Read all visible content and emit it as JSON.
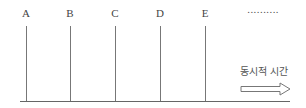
{
  "diagram": {
    "labels": [
      {
        "text": "A",
        "x": 26
      },
      {
        "text": "B",
        "x": 70
      },
      {
        "text": "C",
        "x": 115
      },
      {
        "text": "D",
        "x": 160
      },
      {
        "text": "E",
        "x": 205
      }
    ],
    "continuation": "..........",
    "caption": "동시적 시간",
    "arrow_icon": "right-hollow-arrow",
    "line_color": "#777777"
  }
}
